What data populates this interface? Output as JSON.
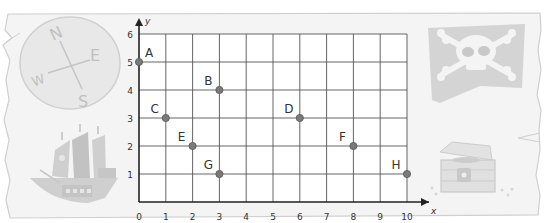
{
  "chart_data": {
    "type": "scatter",
    "title": "",
    "xlabel": "x",
    "ylabel": "y",
    "xlim": [
      0,
      10
    ],
    "ylim": [
      0,
      6
    ],
    "grid": true,
    "legend": "none",
    "x_ticks": [
      "0",
      "1",
      "2",
      "3",
      "4",
      "5",
      "6",
      "7",
      "8",
      "9",
      "10"
    ],
    "y_ticks": [
      "1",
      "2",
      "3",
      "4",
      "5",
      "6"
    ],
    "points": [
      {
        "label": "A",
        "x": 0,
        "y": 5
      },
      {
        "label": "B",
        "x": 3,
        "y": 4
      },
      {
        "label": "C",
        "x": 1,
        "y": 3
      },
      {
        "label": "D",
        "x": 6,
        "y": 3
      },
      {
        "label": "E",
        "x": 2,
        "y": 2
      },
      {
        "label": "F",
        "x": 8,
        "y": 2
      },
      {
        "label": "G",
        "x": 3,
        "y": 1
      },
      {
        "label": "H",
        "x": 10,
        "y": 1
      }
    ]
  },
  "decorations": {
    "compass": {
      "icon": "compass-icon",
      "letters": {
        "n": "N",
        "e": "E",
        "s": "S",
        "w": "W"
      }
    },
    "flag": {
      "icon": "skull-crossbones-flag-icon"
    },
    "ship": {
      "icon": "pirate-ship-icon"
    },
    "chest": {
      "icon": "treasure-chest-icon"
    }
  },
  "colors": {
    "background": "#ffffff",
    "parchment": "#f4f4f4",
    "parchment_edge": "#c8c8c8",
    "grid": "#555555",
    "axis": "#222222",
    "point": "#7a7a7a",
    "point_stroke": "#555555",
    "text": "#333333",
    "deco": "#d2d2d2",
    "deco_dark": "#b8b8b8"
  }
}
